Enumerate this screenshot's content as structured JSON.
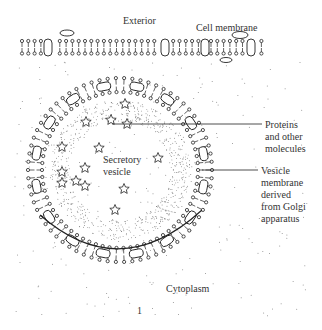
{
  "diagram": {
    "labels": {
      "exterior": "Exterior",
      "cell_membrane": "Cell membrane",
      "proteins_line1": "Proteins",
      "proteins_line2": "and other",
      "proteins_line3": "molecules",
      "vesicle_membrane_line1": "Vesicle",
      "vesicle_membrane_line2": "membrane",
      "vesicle_membrane_line3": "derived",
      "vesicle_membrane_line4": "from Golgi",
      "vesicle_membrane_line5": "apparatus",
      "secretory_line1": "Secretory",
      "secretory_line2": "vesicle",
      "cytoplasm": "Cytoplasm",
      "figure_number": "1"
    },
    "colors": {
      "ink": "#222222",
      "background": "#ffffff"
    }
  }
}
